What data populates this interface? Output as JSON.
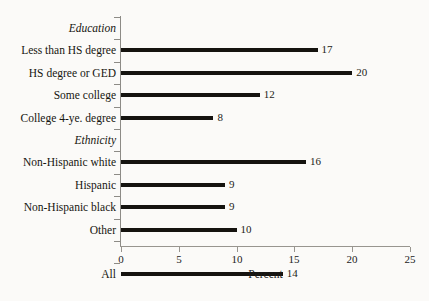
{
  "chart_data": {
    "type": "bar",
    "orientation": "horizontal",
    "title": "",
    "xlabel": "Percent",
    "ylabel": "",
    "xlim": [
      0,
      25
    ],
    "xticks": [
      0,
      5,
      10,
      15,
      20,
      25
    ],
    "grid": false,
    "legend": null,
    "value_labels": true,
    "groups": [
      {
        "header": "Education",
        "rows": [
          {
            "label": "Less than HS degree",
            "value": 17
          },
          {
            "label": "HS degree or GED",
            "value": 20
          },
          {
            "label": "Some college",
            "value": 12
          },
          {
            "label": "College 4-ye. degree",
            "value": 8
          }
        ]
      },
      {
        "header": "Ethnicity",
        "rows": [
          {
            "label": "Non-Hispanic white",
            "value": 16
          },
          {
            "label": "Hispanic",
            "value": 9
          },
          {
            "label": "Non-Hispanic black",
            "value": 9
          },
          {
            "label": "Other",
            "value": 10
          }
        ]
      },
      {
        "header": "",
        "rows": [
          {
            "label": "All",
            "value": 14
          }
        ]
      }
    ],
    "categories": [
      "Less than HS degree",
      "HS degree or GED",
      "Some college",
      "College 4-ye. degree",
      "Non-Hispanic white",
      "Hispanic",
      "Non-Hispanic black",
      "Other",
      "All"
    ],
    "values": [
      17,
      20,
      12,
      8,
      16,
      9,
      9,
      10,
      14
    ],
    "bar_color": "#15130f",
    "axis_color": "#8d8b86",
    "background_color": "#fbfaf8"
  }
}
